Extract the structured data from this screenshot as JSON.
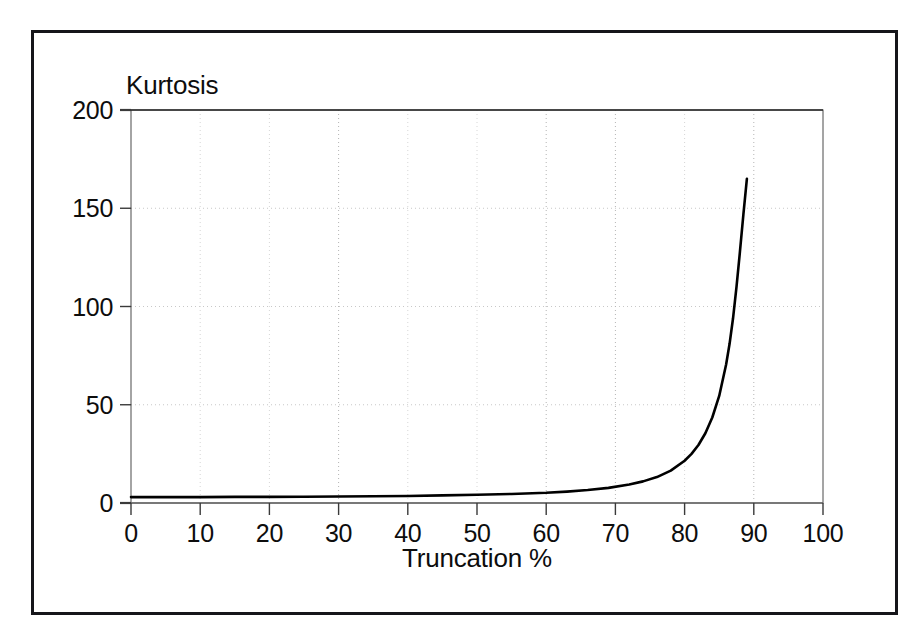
{
  "chart_data": {
    "type": "line",
    "title": "",
    "xlabel": "Truncation %",
    "ylabel": "Kurtosis",
    "xlim": [
      0,
      100
    ],
    "ylim": [
      0,
      200
    ],
    "xticks": [
      0,
      10,
      20,
      30,
      40,
      50,
      60,
      70,
      80,
      90,
      100
    ],
    "yticks": [
      0,
      50,
      100,
      150,
      200
    ],
    "xtick_labels": [
      "0",
      "10",
      "20",
      "30",
      "40",
      "50",
      "60",
      "70",
      "80",
      "90",
      "100"
    ],
    "ytick_labels": [
      "0",
      "50",
      "100",
      "150",
      "200"
    ],
    "grid": true,
    "grid_style": "dotted",
    "legend": false,
    "series": [
      {
        "name": "Kurtosis vs Truncation",
        "color": "#000000",
        "x": [
          0,
          5,
          10,
          15,
          20,
          25,
          30,
          35,
          40,
          45,
          50,
          55,
          60,
          63,
          66,
          69,
          72,
          74,
          76,
          78,
          80,
          81,
          82,
          83,
          84,
          85,
          86,
          86.5,
          87,
          87.5,
          88,
          88.5,
          89
        ],
        "y": [
          3.0,
          3.0,
          3.0,
          3.1,
          3.1,
          3.2,
          3.3,
          3.4,
          3.6,
          3.9,
          4.2,
          4.6,
          5.2,
          5.8,
          6.6,
          7.7,
          9.4,
          11.0,
          13.2,
          16.5,
          21.5,
          25.0,
          29.5,
          35.5,
          43.5,
          54.5,
          70.5,
          81.0,
          94.0,
          110.0,
          128.0,
          147.0,
          165.0
        ]
      }
    ]
  },
  "axes_geometry": {
    "plot_left": 131,
    "plot_right": 823,
    "plot_top": 110,
    "plot_bottom": 503
  },
  "colors": {
    "frame": "#16161a",
    "axis": "#4a4a4a",
    "grid": "#c8c8c8",
    "curve": "#000000",
    "text": "#0d0d0d",
    "background": "#ffffff"
  }
}
